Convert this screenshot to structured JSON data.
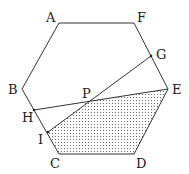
{
  "diagram": {
    "type": "geometry",
    "shape": "hexagon",
    "vertices": {
      "A": {
        "label": "A",
        "x": 59,
        "y": 23,
        "lx": 46,
        "ly": 22
      },
      "F": {
        "label": "F",
        "x": 134,
        "y": 23,
        "lx": 137,
        "ly": 22
      },
      "B": {
        "label": "B",
        "x": 22,
        "y": 89,
        "lx": 8,
        "ly": 94
      },
      "E": {
        "label": "E",
        "x": 168,
        "y": 89,
        "lx": 172,
        "ly": 94
      },
      "C": {
        "label": "C",
        "x": 59,
        "y": 154,
        "lx": 50,
        "ly": 168
      },
      "D": {
        "label": "D",
        "x": 134,
        "y": 154,
        "lx": 136,
        "ly": 168
      }
    },
    "points": {
      "G": {
        "label": "G",
        "x": 151,
        "y": 56,
        "lx": 156,
        "ly": 59
      },
      "H": {
        "label": "H",
        "x": 34,
        "y": 110,
        "lx": 22,
        "ly": 122
      },
      "I": {
        "label": "I",
        "x": 48,
        "y": 132,
        "lx": 38,
        "ly": 144
      },
      "P": {
        "label": "P",
        "x": 88,
        "y": 101,
        "lx": 82,
        "ly": 98
      }
    },
    "segments": [
      "G-I",
      "H-E"
    ],
    "shaded_region": {
      "vertices": [
        "P",
        "E",
        "D",
        "C",
        "I"
      ],
      "pattern": "dots"
    },
    "colors": {
      "stroke": "#333333",
      "dots": "#555555",
      "text": "#222222"
    }
  }
}
